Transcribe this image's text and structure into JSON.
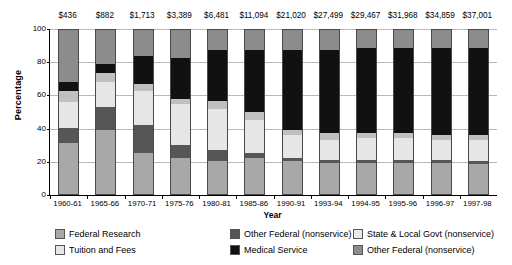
{
  "chart_data": {
    "type": "bar",
    "subtype": "stacked-percentage",
    "title": "",
    "xlabel": "Year",
    "ylabel": "Percentage",
    "ylim": [
      0,
      100
    ],
    "yticks": [
      0,
      20,
      40,
      60,
      80,
      100
    ],
    "grid": true,
    "legend_position": "bottom",
    "categories": [
      "1960-61",
      "1965-66",
      "1970-71",
      "1975-76",
      "1980-81",
      "1985-86",
      "1990-91",
      "1993-94",
      "1994-95",
      "1995-96",
      "1996-97",
      "1997-98"
    ],
    "point_labels": [
      "$436",
      "$882",
      "$1,713",
      "$3,389",
      "$6,481",
      "$11,094",
      "$21,020",
      "$27,499",
      "$29,467",
      "$31,968",
      "$34,859",
      "$37,001"
    ],
    "series": [
      {
        "name": "Federal Research",
        "color": "#a8a8a8",
        "values": [
          31,
          39,
          25,
          22,
          20,
          22,
          20,
          19,
          19,
          19,
          19,
          18
        ]
      },
      {
        "name": "Other Federal (nonservice)",
        "color": "#565656",
        "values": [
          9,
          14,
          17,
          8,
          7,
          3,
          2,
          2,
          2,
          2,
          2,
          2
        ]
      },
      {
        "name": "Tuition and Fees",
        "color": "#e6e6e6",
        "values": [
          16,
          15,
          21,
          25,
          25,
          20,
          14,
          12,
          13,
          13,
          12,
          13
        ]
      },
      {
        "name": "State & Local Govt (nonservice)",
        "color": "#c0c0c0",
        "values": [
          7,
          6,
          4,
          3,
          5,
          5,
          3,
          4,
          3,
          3,
          3,
          3
        ]
      },
      {
        "name": "Medical Service",
        "color": "#111111",
        "values": [
          5,
          5,
          17,
          25,
          31,
          38,
          49,
          51,
          52,
          52,
          53,
          53
        ]
      },
      {
        "name": "Other Federal (nonservice)",
        "color": "#8c8c8c",
        "values": [
          32,
          21,
          16,
          17,
          12,
          12,
          12,
          12,
          11,
          11,
          11,
          11
        ]
      }
    ],
    "legend": [
      {
        "label": "Federal Research",
        "color": "#a8a8a8"
      },
      {
        "label": "Other Federal (nonservice)",
        "color": "#565656"
      },
      {
        "label": "State & Local Govt (nonservice)",
        "color": "#e8e8e8"
      },
      {
        "label": "Tuition and Fees",
        "color": "#e6e6e6"
      },
      {
        "label": "Medical Service",
        "color": "#111111"
      },
      {
        "label": "Other Federal (nonservice)",
        "color": "#8c8c8c"
      }
    ]
  }
}
